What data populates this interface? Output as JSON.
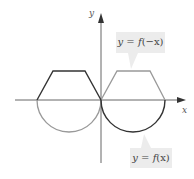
{
  "diagram": {
    "axes": {
      "x_label": "x",
      "y_label": "y"
    },
    "labels": {
      "reflected": {
        "prefix": "y",
        "eq": " = ",
        "func": "f",
        "arg": "(−x)"
      },
      "original": {
        "prefix": "y",
        "eq": " = ",
        "func": "f",
        "arg": "(x)"
      }
    },
    "colors": {
      "original_curve": "#333333",
      "reflected_curve": "#999999",
      "axis": "#555555",
      "label_bg": "#ececec"
    },
    "curves": [
      {
        "name": "y = f(x)",
        "shape": "trapezoid on x<0 above axis, semicircle on x>0 below axis"
      },
      {
        "name": "y = f(-x)",
        "shape": "trapezoid on x>0 above axis, semicircle on x<0 below axis"
      }
    ]
  }
}
